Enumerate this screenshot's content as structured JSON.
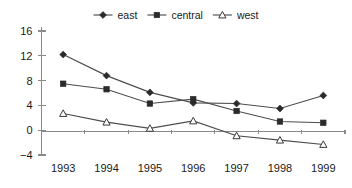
{
  "chart_data": {
    "type": "line",
    "title": "",
    "xlabel": "",
    "ylabel": "",
    "categories": [
      "1993",
      "1994",
      "1995",
      "1996",
      "1997",
      "1998",
      "1999"
    ],
    "series": [
      {
        "name": "east",
        "marker": "filled-diamond",
        "values": [
          12.2,
          8.8,
          6.1,
          4.4,
          4.3,
          3.5,
          5.6
        ]
      },
      {
        "name": "central",
        "marker": "filled-square",
        "values": [
          7.5,
          6.6,
          4.3,
          5.0,
          3.1,
          1.4,
          1.2
        ]
      },
      {
        "name": "west",
        "marker": "open-triangle",
        "values": [
          2.7,
          1.3,
          0.3,
          1.5,
          -0.9,
          -1.6,
          -2.3
        ]
      }
    ],
    "ylim": [
      -4,
      16
    ],
    "yticks": [
      16,
      12,
      8,
      4,
      0,
      -4
    ],
    "ytick_labels": [
      "16",
      "12",
      "8",
      "4",
      "0",
      "−4"
    ],
    "grid": false,
    "legend_position": "top-center",
    "colors": {
      "line": "#4d4d4d",
      "marker_fill": "#2b2b2b",
      "marker_open_fill": "#ffffff",
      "axis": "#8a8a8a",
      "text": "#1a1a1a",
      "background": "#ffffff"
    }
  },
  "legend": {
    "items": [
      {
        "label": "east"
      },
      {
        "label": "central"
      },
      {
        "label": "west"
      }
    ]
  }
}
